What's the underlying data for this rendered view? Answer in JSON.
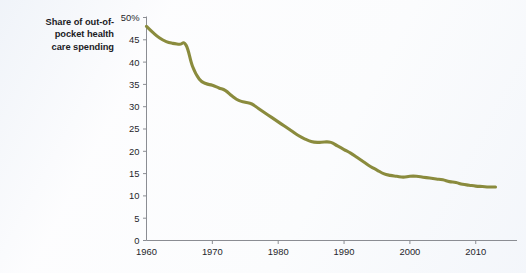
{
  "chart_data": {
    "type": "line",
    "title_lines": [
      "Share of out-of-",
      "pocket health",
      "care spending"
    ],
    "xlabel": "",
    "ylabel": "",
    "xlim": [
      1960,
      2013
    ],
    "ylim": [
      0,
      50
    ],
    "grid": false,
    "legend": "none",
    "line_color": "#8a8b3d",
    "axis_color": "#8b8d93",
    "y_ticks": [
      0,
      5,
      10,
      15,
      20,
      25,
      30,
      35,
      40,
      45,
      50
    ],
    "y_tick_labels": [
      "0",
      "5",
      "10",
      "15",
      "20",
      "25",
      "30",
      "35",
      "40",
      "45",
      "50%"
    ],
    "x_ticks": [
      1960,
      1970,
      1980,
      1990,
      2000,
      2010
    ],
    "x_tick_labels": [
      "1960",
      "1970",
      "1980",
      "1990",
      "2000",
      "2010"
    ],
    "series": [
      {
        "name": "Share of out-of-pocket health care spending",
        "units": "percent",
        "x": [
          1960,
          1961,
          1962,
          1963,
          1964,
          1965,
          1966,
          1967,
          1968,
          1969,
          1970,
          1971,
          1972,
          1973,
          1974,
          1975,
          1976,
          1977,
          1978,
          1979,
          1980,
          1981,
          1982,
          1983,
          1984,
          1985,
          1986,
          1987,
          1988,
          1989,
          1990,
          1991,
          1992,
          1993,
          1994,
          1995,
          1996,
          1997,
          1998,
          1999,
          2000,
          2001,
          2002,
          2003,
          2004,
          2005,
          2006,
          2007,
          2008,
          2009,
          2010,
          2011,
          2012,
          2013
        ],
        "values": [
          48.0,
          46.6,
          45.4,
          44.6,
          44.2,
          44.0,
          43.8,
          39.0,
          36.2,
          35.2,
          34.8,
          34.2,
          33.6,
          32.4,
          31.4,
          31.0,
          30.6,
          29.6,
          28.6,
          27.6,
          26.6,
          25.6,
          24.6,
          23.6,
          22.8,
          22.2,
          22.0,
          22.1,
          22.0,
          21.2,
          20.4,
          19.6,
          18.6,
          17.6,
          16.6,
          15.8,
          15.0,
          14.6,
          14.4,
          14.2,
          14.4,
          14.4,
          14.2,
          14.0,
          13.8,
          13.6,
          13.2,
          13.0,
          12.6,
          12.4,
          12.2,
          12.1,
          12.0,
          12.0
        ]
      }
    ]
  }
}
